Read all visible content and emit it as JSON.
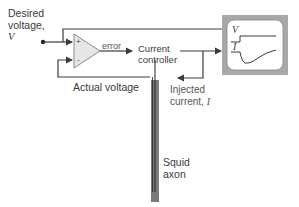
{
  "labels": {
    "desired_line1": "Desired",
    "desired_line2": "voltage,",
    "desired_var": "V",
    "error": "error",
    "controller_line1": "Current",
    "controller_line2": "controller",
    "actual_voltage": "Actual voltage",
    "injected_line1": "Injected",
    "injected_line2": "current,",
    "injected_var": "I",
    "axon_line1": "Squid",
    "axon_line2": "axon",
    "scope_v": "V",
    "scope_i": "I",
    "amp_plus": "+",
    "amp_minus": "-"
  },
  "colors": {
    "line": "#3a3a3a",
    "amp_fill": "#e6e6e6",
    "scope_frame": "#a8a8a8",
    "scope_screen": "#ffffff",
    "axon": "#7a7a7a"
  }
}
